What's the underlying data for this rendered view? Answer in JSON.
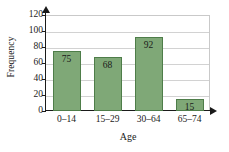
{
  "chart_data": {
    "type": "bar",
    "title": "",
    "categories": [
      "0–14",
      "15–29",
      "30–64",
      "65–74"
    ],
    "values": [
      75,
      68,
      92,
      15
    ],
    "xlabel": "Age",
    "ylabel": "Frequency",
    "ylim": [
      0,
      120
    ],
    "ytick_labels": [
      "0",
      "20",
      "40",
      "60",
      "80",
      "100",
      "120"
    ],
    "ytick_values": [
      0,
      20,
      40,
      60,
      80,
      100,
      120
    ],
    "grid": "horizontal",
    "legend": "none",
    "bar_color": "#7fa877",
    "bar_border_color": "#4e7d49",
    "gridline_color": "#d2d2d2",
    "axis_color": "#1a1a1a",
    "background_color": "#ffffff",
    "data_labels": [
      "75",
      "68",
      "92",
      "15"
    ]
  }
}
